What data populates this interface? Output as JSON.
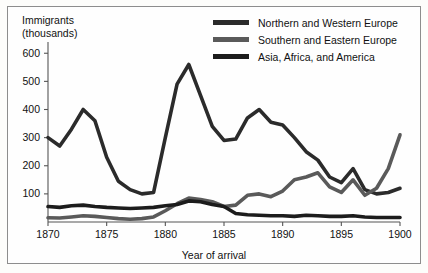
{
  "figure": {
    "background_color": "#fdfdfb",
    "frame_color": "#8d8d8d",
    "axis_color": "#555555"
  },
  "legend": {
    "position": "top-right",
    "entries": [
      {
        "label": "Northern and Western Europe",
        "color": "#2b2b2b",
        "swatch": "line-swatch"
      },
      {
        "label": "Southern and Eastern Europe",
        "color": "#5a5a5a",
        "swatch": "line-swatch"
      },
      {
        "label": "Asia, Africa, and America",
        "color": "#1c1c1c",
        "swatch": "line-swatch"
      }
    ]
  },
  "axes": {
    "y_title": "Immigrants\n(thousands)",
    "x_title": "Year of arrival",
    "y_ticks": [
      100,
      200,
      300,
      400,
      500,
      600
    ],
    "x_ticks": [
      1870,
      1875,
      1880,
      1885,
      1890,
      1895,
      1900
    ]
  },
  "chart_data": {
    "type": "line",
    "title": "",
    "subtitle": "",
    "xlabel": "Year of arrival",
    "ylabel": "Immigrants (thousands)",
    "xlim": [
      1870,
      1900
    ],
    "ylim": [
      0,
      640
    ],
    "grid": false,
    "legend_position": "top-right",
    "x": [
      1870,
      1871,
      1872,
      1873,
      1874,
      1875,
      1876,
      1877,
      1878,
      1879,
      1880,
      1881,
      1882,
      1883,
      1884,
      1885,
      1886,
      1887,
      1888,
      1889,
      1890,
      1891,
      1892,
      1893,
      1894,
      1895,
      1896,
      1897,
      1898,
      1899,
      1900
    ],
    "series": [
      {
        "name": "Northern and Western Europe",
        "color": "#2b2b2b",
        "values": [
          300,
          270,
          330,
          400,
          360,
          230,
          145,
          115,
          100,
          105,
          300,
          490,
          560,
          450,
          340,
          290,
          295,
          370,
          400,
          355,
          345,
          300,
          250,
          220,
          160,
          140,
          190,
          115,
          100,
          105,
          120
        ]
      },
      {
        "name": "Southern and Eastern Europe",
        "color": "#5a5a5a",
        "values": [
          15,
          14,
          18,
          22,
          20,
          16,
          12,
          10,
          12,
          18,
          40,
          65,
          85,
          80,
          72,
          55,
          60,
          95,
          100,
          90,
          110,
          150,
          160,
          175,
          125,
          105,
          150,
          95,
          120,
          190,
          310
        ]
      },
      {
        "name": "Asia, Africa, and America",
        "color": "#1c1c1c",
        "values": [
          55,
          52,
          58,
          60,
          55,
          52,
          50,
          48,
          50,
          52,
          58,
          62,
          75,
          72,
          62,
          55,
          30,
          26,
          24,
          22,
          22,
          20,
          24,
          22,
          20,
          20,
          22,
          18,
          16,
          16,
          16
        ]
      }
    ]
  }
}
